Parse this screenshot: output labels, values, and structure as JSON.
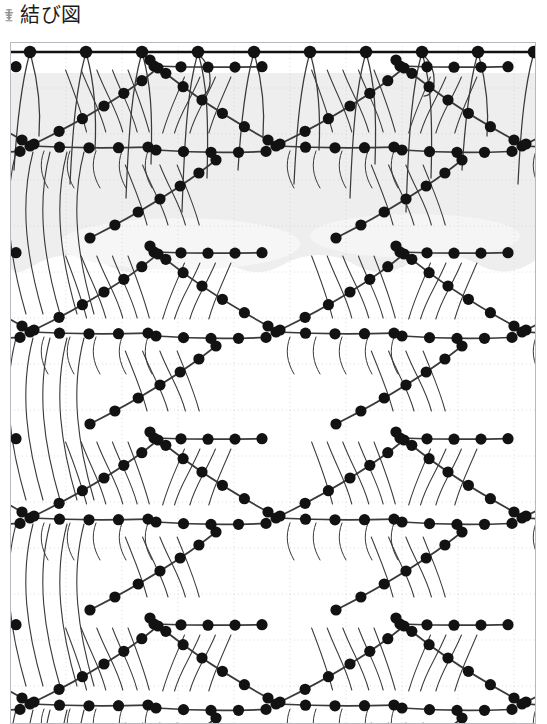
{
  "header": {
    "title": "結び図",
    "icon": "knot-glyph-icon"
  },
  "diagram": {
    "name": "knot-pattern-diagram",
    "caption": "結び図",
    "colors": {
      "ink": "#1b1b1b",
      "cord": "#3a3a3a",
      "knot": "#121212",
      "grid_line": "#c9c9cf",
      "shade": "#ebebeb",
      "frame": "#b8b8c0",
      "background": "#ffffff"
    },
    "geometry": {
      "frame_left": 10,
      "frame_right": 536,
      "frame_top": 12,
      "frame_bottom": 694,
      "grid_spacing_x": 56,
      "grid_spacing_y": 46,
      "knot_radius": 5.6,
      "cord_width": 1.6,
      "header_bar_y": 22,
      "header_bar_width": 2.6,
      "column_spacing": 56,
      "row_period": 186,
      "shade_top": 43,
      "shade_bottom": 236
    },
    "top_bar": {
      "name": "foundation-cord",
      "knot_count": 10,
      "knot_x": [
        30,
        86,
        142,
        198,
        254,
        272,
        328,
        384,
        440,
        496
      ],
      "knot_y": 22
    },
    "motif": {
      "name": "leaf-lattice-motif",
      "repeat_x": 246,
      "repeat_y": 186,
      "columns": 2,
      "rows": 4,
      "description": "交差する斜めの結び目列が葉形を作る繰り返し模様"
    }
  }
}
